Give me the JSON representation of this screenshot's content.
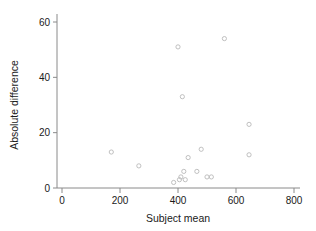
{
  "chart_data": {
    "type": "scatter",
    "title": "",
    "xlabel": "Subject mean",
    "ylabel": "Absolute difference",
    "xlim": [
      0,
      830
    ],
    "ylim": [
      0,
      63
    ],
    "xticks": [
      0,
      200,
      400,
      600,
      800
    ],
    "yticks": [
      0,
      20,
      40,
      60
    ],
    "xtick_labels": [
      "0",
      "200",
      "400",
      "600",
      "800"
    ],
    "ytick_labels": [
      "0",
      "20",
      "40",
      "60"
    ],
    "grid": false,
    "legend": null,
    "marker": {
      "shape": "open-circle",
      "radius": 2.1,
      "color": "#b9b9b9"
    },
    "points": [
      {
        "x": 170,
        "y": 13
      },
      {
        "x": 265,
        "y": 8
      },
      {
        "x": 385,
        "y": 2
      },
      {
        "x": 400,
        "y": 51
      },
      {
        "x": 405,
        "y": 3
      },
      {
        "x": 410,
        "y": 4
      },
      {
        "x": 415,
        "y": 33
      },
      {
        "x": 420,
        "y": 6
      },
      {
        "x": 425,
        "y": 3
      },
      {
        "x": 435,
        "y": 11
      },
      {
        "x": 465,
        "y": 6
      },
      {
        "x": 480,
        "y": 14
      },
      {
        "x": 500,
        "y": 4
      },
      {
        "x": 515,
        "y": 4
      },
      {
        "x": 560,
        "y": 54
      },
      {
        "x": 645,
        "y": 23
      },
      {
        "x": 645,
        "y": 12
      }
    ]
  },
  "axes": {
    "x_title": "Subject mean",
    "y_title": "Absolute difference"
  }
}
